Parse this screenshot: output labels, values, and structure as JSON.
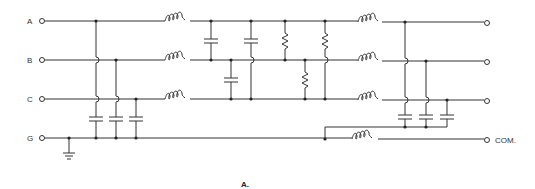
{
  "diagram": {
    "type": "circuit-schematic",
    "caption": "A.",
    "inputs": [
      {
        "label": "A",
        "y": 21
      },
      {
        "label": "B",
        "y": 60
      },
      {
        "label": "C",
        "y": 99
      },
      {
        "label": "G",
        "y": 138
      }
    ],
    "output_label": "COM.",
    "colors": {
      "line": "#333333",
      "background": "#ffffff"
    }
  }
}
